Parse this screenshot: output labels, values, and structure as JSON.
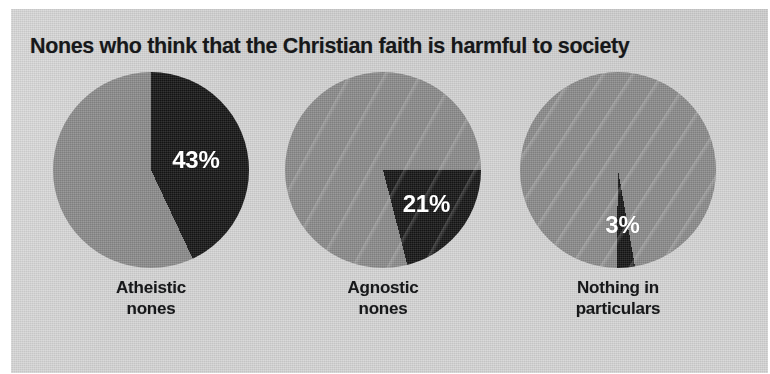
{
  "chart_data": {
    "type": "pie",
    "title": "Nones who think that the Christian faith is harmful to society",
    "subtitle": "",
    "xlabel": "",
    "ylabel": "",
    "legend": "none",
    "grid": false,
    "panels": [
      {
        "category": "Atheistic nones",
        "category_line1": "Atheistic",
        "category_line2": "nones",
        "value": 43,
        "value_label": "43%",
        "remainder": 57,
        "slices": [
          {
            "name": "harmful",
            "value": 43,
            "color": "#171717"
          },
          {
            "name": "not-harmful",
            "value": 57,
            "color": "#8c8c8c"
          }
        ],
        "start_angle_deg": 0
      },
      {
        "category": "Agnostic nones",
        "category_line1": "Agnostic",
        "category_line2": "nones",
        "value": 21,
        "value_label": "21%",
        "remainder": 79,
        "slices": [
          {
            "name": "harmful",
            "value": 21,
            "color": "#171717"
          },
          {
            "name": "not-harmful",
            "value": 79,
            "color": "#8c8c8c"
          }
        ],
        "start_angle_deg": 90
      },
      {
        "category": "Nothing in particulars",
        "category_line1": "Nothing in",
        "category_line2": "particulars",
        "value": 3,
        "value_label": "3%",
        "remainder": 97,
        "slices": [
          {
            "name": "harmful",
            "value": 3,
            "color": "#171717"
          },
          {
            "name": "not-harmful",
            "value": 97,
            "color": "#8c8c8c"
          }
        ],
        "start_angle_deg": 170
      }
    ],
    "categories": [
      "Atheistic nones",
      "Agnostic nones",
      "Nothing in particulars"
    ],
    "values": [
      43,
      21,
      3
    ],
    "units": "percent",
    "ylim": [
      0,
      100
    ]
  },
  "colors": {
    "background": "#ffffff",
    "panel": "#d3d3d3",
    "slice_dark": "#171717",
    "slice_light": "#8c8c8c",
    "title_text": "#17181a",
    "value_text": "#ffffff"
  }
}
